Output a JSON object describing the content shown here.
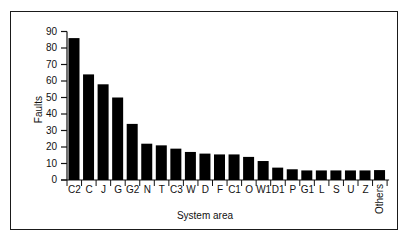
{
  "chart_data": {
    "type": "bar",
    "title": "",
    "xlabel": "System area",
    "ylabel": "Faults",
    "ylim": [
      0,
      90
    ],
    "yticks": [
      0,
      10,
      20,
      30,
      40,
      50,
      60,
      70,
      80,
      90
    ],
    "grid": false,
    "legend": null,
    "categories": [
      "C2",
      "C",
      "J",
      "G",
      "G2",
      "N",
      "T",
      "C3",
      "W",
      "D",
      "F",
      "C1",
      "O",
      "W1",
      "D1",
      "P",
      "G1",
      "L",
      "S",
      "U",
      "Z",
      "Others"
    ],
    "values": [
      86,
      64,
      58,
      50,
      34,
      22,
      21,
      19,
      17,
      16,
      15.5,
      15.5,
      14,
      11.5,
      7.5,
      6.5,
      5.8,
      5.8,
      5.8,
      5.8,
      5.8,
      6
    ],
    "bar_color": "#000000"
  },
  "axes": {
    "ylabel": "Faults",
    "xlabel": "System area",
    "yticks": [
      "0",
      "10",
      "20",
      "30",
      "40",
      "50",
      "60",
      "70",
      "80",
      "90"
    ]
  }
}
